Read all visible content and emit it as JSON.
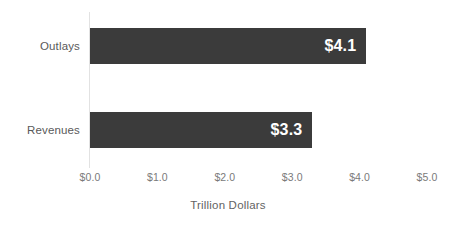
{
  "chart_data": {
    "type": "bar",
    "orientation": "horizontal",
    "title": "",
    "subtitle": "",
    "categories": [
      "Outlays",
      "Revenues"
    ],
    "values": [
      4.1,
      3.3
    ],
    "value_labels": [
      "$4.1",
      "$3.3"
    ],
    "series": [
      {
        "name": "",
        "values": [
          4.1,
          3.3
        ]
      }
    ],
    "xlabel": "Trillion Dollars",
    "ylabel": "",
    "xlim": [
      0.0,
      5.0
    ],
    "xtick_values": [
      0.0,
      1.0,
      2.0,
      3.0,
      4.0,
      5.0
    ],
    "xtick_labels": [
      "$0.0",
      "$1.0",
      "$2.0",
      "$3.0",
      "$4.0",
      "$5.0"
    ],
    "ytick_labels": [
      "Outlays",
      "Revenues"
    ],
    "grid": false,
    "legend": false,
    "legend_position": "none",
    "annotations": []
  },
  "style": {
    "bar_color": "#3b3b3b",
    "value_label_color": "#ffffff",
    "category_label_color": "#595959",
    "tick_label_color": "#7a7a7a",
    "axis_title_color": "#636363",
    "axis_line_color": "#e2e2e2",
    "background_color": "#ffffff"
  }
}
